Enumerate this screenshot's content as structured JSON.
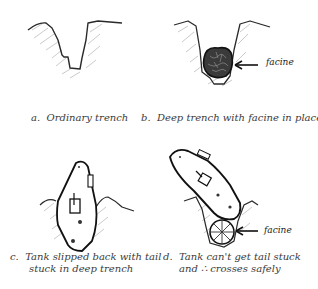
{
  "panels": [
    {
      "id": "a",
      "caption_prefix": "a.",
      "caption_lines": [
        "Ordinary trench"
      ],
      "drawing": "ordinary-trench"
    },
    {
      "id": "b",
      "caption_prefix": "b.",
      "caption_lines": [
        "Deep trench with facine in place"
      ],
      "drawing": "deep-trench-with-facine",
      "annotation": "facine"
    },
    {
      "id": "c",
      "caption_prefix": "c.",
      "caption_lines": [
        "Tank slipped back with tail",
        "stuck in deep trench"
      ],
      "drawing": "tank-stuck-in-trench"
    },
    {
      "id": "d",
      "caption_prefix": "d.",
      "caption_lines": [
        "Tank can't get tail stuck",
        "and ∴ crosses safely"
      ],
      "drawing": "tank-crossing-on-facine",
      "annotation": "facine"
    }
  ],
  "colors": {
    "ink": "#2a2a2a",
    "hatch": "#b8b8b8",
    "background": "#ffffff"
  }
}
